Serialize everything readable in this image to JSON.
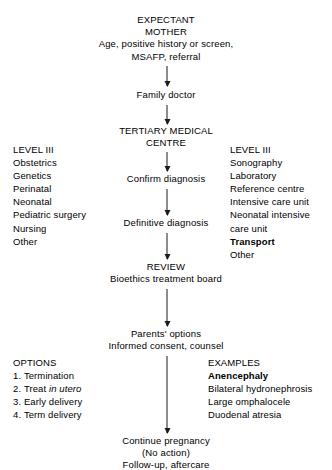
{
  "diagram": {
    "nodes": {
      "expectant_mother": {
        "lines": [
          "EXPECTANT",
          "MOTHER",
          "Age, positive history or screen,",
          "MSAFP, referral"
        ]
      },
      "family_doctor": {
        "lines": [
          "Family doctor"
        ]
      },
      "tertiary_medical_centre": {
        "lines": [
          "TERTIARY MEDICAL",
          "CENTRE"
        ]
      },
      "confirm_diagnosis": {
        "lines": [
          "Confirm diagnosis"
        ]
      },
      "definitive_diagnosis": {
        "lines": [
          "Definitive diagnosis"
        ]
      },
      "review": {
        "lines": [
          "REVIEW",
          "Bioethics treatment board"
        ]
      },
      "parents_options": {
        "lines": [
          "Parents' options",
          "Informed consent, counsel"
        ]
      },
      "continue_pregnancy": {
        "lines": [
          "Continue pregnancy",
          "(No action)",
          "Follow-up, aftercare"
        ]
      }
    },
    "left_level_iii": {
      "heading": "LEVEL III",
      "items": [
        "Obstetrics",
        "Genetics",
        "Perinatal",
        "Neonatal",
        "Pediatric surgery",
        "Nursing",
        "Other"
      ]
    },
    "right_level_iii": {
      "heading": "LEVEL III",
      "items": [
        "Sonography",
        "Laboratory",
        "Reference centre",
        "Intensive care unit",
        "Neonatal intensive",
        "care unit",
        "Transport",
        "Other"
      ],
      "bold_items": [
        "Transport"
      ]
    },
    "options": {
      "heading": "OPTIONS",
      "items": [
        {
          "number": "1.",
          "text": "Termination"
        },
        {
          "number": "2.",
          "text_before": "Treat ",
          "text_italic": "in utero",
          "text_after": ""
        },
        {
          "number": "3.",
          "text": "Early delivery"
        },
        {
          "number": "4.",
          "text": "Term delivery"
        }
      ]
    },
    "examples": {
      "heading": "EXAMPLES",
      "items": [
        "Anencephaly",
        "Bilateral hydronephrosis",
        "Large omphalocele",
        "Duodenal atresia"
      ],
      "bold_items": [
        "Anencephaly"
      ]
    },
    "colors": {
      "background": "#ffffff",
      "text": "#000000",
      "arrow": "#1a1a1a"
    }
  }
}
